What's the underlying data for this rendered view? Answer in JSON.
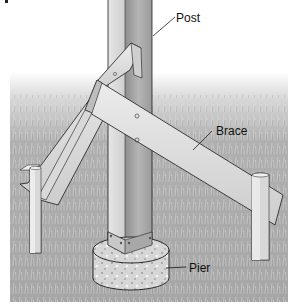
{
  "figure": {
    "labels": {
      "post": "Post",
      "brace": "Brace",
      "pier": "Pier"
    }
  },
  "colors": {
    "background": "#ffffff",
    "grass": "#a9a9a9",
    "grass_light": "#cfcfcf",
    "wood_light": "#e2e2e2",
    "wood_mid": "#c8c8c8",
    "wood_dark": "#9a9a9a",
    "outline": "#1a1a1a",
    "concrete": "#d4d4d4"
  }
}
